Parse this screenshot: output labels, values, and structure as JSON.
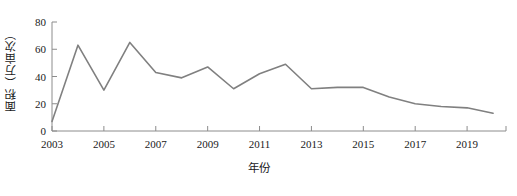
{
  "chart_data": {
    "type": "line",
    "title": "",
    "xlabel": "年份",
    "ylabel": "面积（万亩次）",
    "categories": [
      2003,
      2004,
      2005,
      2006,
      2007,
      2008,
      2009,
      2010,
      2011,
      2012,
      2013,
      2014,
      2015,
      2016,
      2017,
      2018,
      2019,
      2020
    ],
    "values": [
      7,
      63,
      30,
      65,
      43,
      39,
      47,
      31,
      42,
      49,
      31,
      32,
      32,
      25,
      20,
      18,
      17,
      13
    ],
    "series": [
      {
        "name": "面积",
        "values": [
          7,
          63,
          30,
          65,
          43,
          39,
          47,
          31,
          42,
          49,
          31,
          32,
          32,
          25,
          20,
          18,
          17,
          13
        ]
      }
    ],
    "x_tick_labels": [
      "2003",
      "2005",
      "2007",
      "2009",
      "2011",
      "2013",
      "2015",
      "2017",
      "2019"
    ],
    "x_tick_values": [
      2003,
      2005,
      2007,
      2009,
      2011,
      2013,
      2015,
      2017,
      2019
    ],
    "y_tick_labels": [
      "0",
      "20",
      "40",
      "60",
      "80"
    ],
    "y_tick_values": [
      0,
      20,
      40,
      60,
      80
    ],
    "xlim": [
      2003,
      2020.5
    ],
    "ylim": [
      0,
      80
    ],
    "grid": false,
    "legend": false,
    "line_color": "#808080"
  }
}
